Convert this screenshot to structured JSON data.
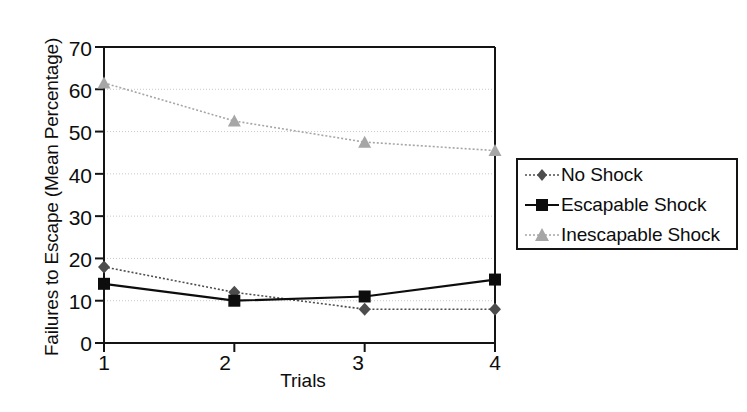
{
  "chart_data": {
    "type": "line",
    "title": "",
    "xlabel": "Trials",
    "ylabel": "Failures to Escape (Mean Percentage)",
    "categories": [
      "1",
      "2",
      "3",
      "4"
    ],
    "x": [
      1,
      2,
      3,
      4
    ],
    "xlim": [
      1,
      4
    ],
    "ylim": [
      0,
      70
    ],
    "yticks": [
      0,
      10,
      20,
      30,
      40,
      50,
      60,
      70
    ],
    "xticks": [
      1,
      2,
      3,
      4
    ],
    "grid": "horizontal-dotted",
    "legend_position": "right",
    "series": [
      {
        "name": "No Shock",
        "values": [
          18,
          12,
          8,
          8
        ],
        "marker": "diamond",
        "line_style": "dotted",
        "color": "#4d4d4d"
      },
      {
        "name": "Escapable Shock",
        "values": [
          14,
          10,
          11,
          15
        ],
        "marker": "square",
        "line_style": "solid",
        "color": "#0d0d0d"
      },
      {
        "name": "Inescapable Shock",
        "values": [
          61.5,
          52.5,
          47.5,
          45.5
        ],
        "marker": "triangle",
        "line_style": "dotted",
        "color": "#a6a6a6"
      }
    ]
  },
  "axes": {
    "y_tick_labels": [
      "70",
      "60",
      "50",
      "40",
      "30",
      "20",
      "10",
      "0"
    ],
    "x_tick_labels": [
      "1",
      "2",
      "3",
      "4"
    ],
    "ylabel": "Failures to Escape (Mean Percentage)",
    "xlabel": "Trials"
  },
  "legend": {
    "items": [
      {
        "label": "No Shock"
      },
      {
        "label": "Escapable Shock"
      },
      {
        "label": "Inescapable Shock"
      }
    ]
  },
  "colors": {
    "axis": "#141414",
    "grid": "#c9c9c9",
    "no_shock": "#4d4d4d",
    "escapable_shock": "#0d0d0d",
    "inescapable_shock": "#a6a6a6",
    "background": "#ffffff"
  }
}
